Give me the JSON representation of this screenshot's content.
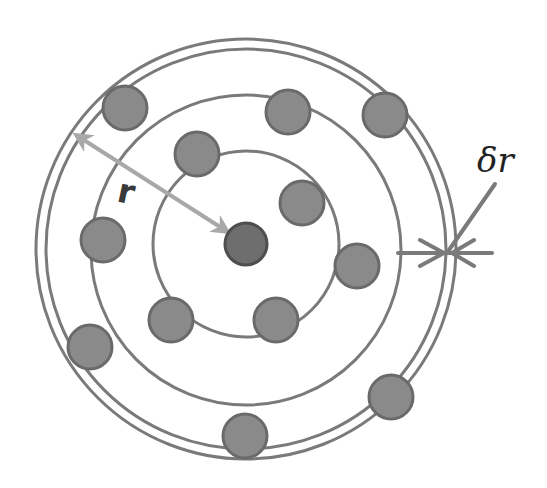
{
  "diagram": {
    "labels": {
      "radius": "r",
      "shell_thickness": "δr"
    },
    "colors": {
      "background": "#ffffff",
      "ring": "#7a7a7a",
      "particle_fill": "#8a8a8a",
      "particle_stroke": "#6a6a6a",
      "center_particle_fill": "#6e6e6e",
      "center_particle_stroke": "#4e4e4e",
      "radius_arrow": "#a8a8a8",
      "delta_arrow": "#7a7a7a",
      "text": "#222222"
    },
    "center": {
      "x": 246,
      "y": 244
    },
    "rings": [
      {
        "name": "inner-shell",
        "radius": 93
      },
      {
        "name": "middle-shell",
        "radius": 155
      },
      {
        "name": "outer-shell-inner-edge",
        "radius": 200
      },
      {
        "name": "outer-shell-outer-edge",
        "radius": 210
      }
    ],
    "particles": [
      {
        "x": 246,
        "y": 244,
        "r": 21,
        "type": "central"
      },
      {
        "x": 125,
        "y": 108,
        "r": 22,
        "type": "shell"
      },
      {
        "x": 197,
        "y": 154,
        "r": 22,
        "type": "shell"
      },
      {
        "x": 288,
        "y": 112,
        "r": 22,
        "type": "shell"
      },
      {
        "x": 385,
        "y": 115,
        "r": 22,
        "type": "shell"
      },
      {
        "x": 302,
        "y": 203,
        "r": 22,
        "type": "shell"
      },
      {
        "x": 103,
        "y": 240,
        "r": 22,
        "type": "shell"
      },
      {
        "x": 357,
        "y": 266,
        "r": 22,
        "type": "shell"
      },
      {
        "x": 171,
        "y": 320,
        "r": 22,
        "type": "shell"
      },
      {
        "x": 276,
        "y": 320,
        "r": 22,
        "type": "shell"
      },
      {
        "x": 90,
        "y": 347,
        "r": 22,
        "type": "shell"
      },
      {
        "x": 391,
        "y": 397,
        "r": 22,
        "type": "shell"
      },
      {
        "x": 245,
        "y": 436,
        "r": 22,
        "type": "shell"
      }
    ]
  }
}
